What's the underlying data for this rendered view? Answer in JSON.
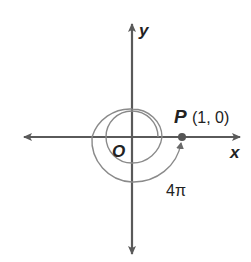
{
  "diagram": {
    "type": "unit-circle-rotation",
    "axes": {
      "x_label": "x",
      "y_label": "y",
      "origin_label": "O"
    },
    "point": {
      "name": "P",
      "coords": "(1, 0)"
    },
    "angle_label": "4π",
    "colors": {
      "axis": "#5a5a5a",
      "spiral": "#8a8a8a",
      "text": "#222222"
    }
  }
}
